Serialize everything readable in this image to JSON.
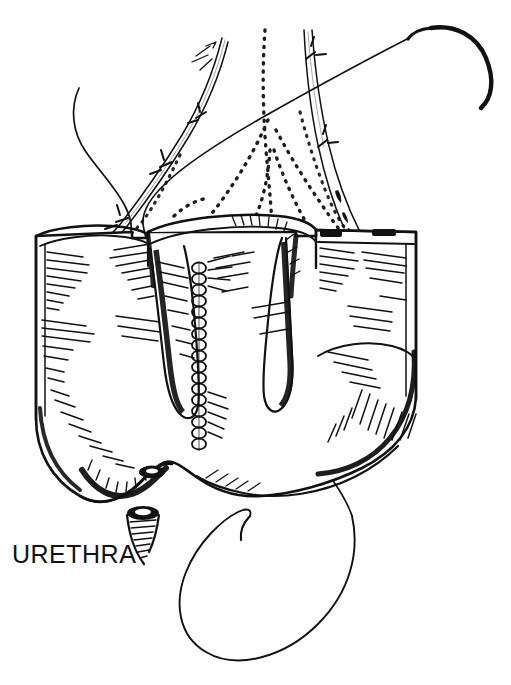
{
  "figure": {
    "domain": "anatomical-line-illustration",
    "background_color": "#ffffff",
    "ink_color": "#111111",
    "width": 511,
    "height": 685,
    "style": "black-and-white pen-and-ink medical line drawing with cross-hatch shading"
  },
  "labels": [
    {
      "id": "urethra",
      "text": "URETHRA",
      "x": 12,
      "y": 540,
      "font_size": 25,
      "color": "#111111"
    }
  ],
  "anatomy": {
    "parts": [
      {
        "name": "left-bladder-flap",
        "note": "left everted wall flap, hatched interior"
      },
      {
        "name": "center-bladder-flap",
        "note": "central tube-like flap with dark medial fold"
      },
      {
        "name": "right-bladder-flap",
        "note": "right everted wall flap, rectangular cut edge"
      },
      {
        "name": "bladder-base",
        "note": "rounded lower bladder body with dense hatching"
      },
      {
        "name": "ureteric-orifice",
        "note": "small dark oval opening on left bladder floor"
      },
      {
        "name": "urethral-stump",
        "note": "short cut tube below bladder neck, ringed shading"
      },
      {
        "name": "left-ureter",
        "note": "tubular vessel descending from upper-left"
      },
      {
        "name": "right-ureter",
        "note": "tubular vessel descending from upper-right"
      },
      {
        "name": "stippled-fascial-planes",
        "note": "dotted peritoneal reflection lines over dome"
      }
    ]
  },
  "instruments": {
    "items": [
      {
        "name": "curved-suture-needle",
        "note": "curved swaged needle at upper right"
      },
      {
        "name": "suture-thread-long",
        "note": "long thread running from needle down-left across field"
      },
      {
        "name": "suture-thread-loop",
        "note": "large free loop of thread hanging below bladder"
      },
      {
        "name": "running-suture-chain",
        "note": "chain of interlocking stitches down the midline"
      },
      {
        "name": "suture-thread-upper-left",
        "note": "thread tail curving at upper left"
      }
    ]
  },
  "colors": {
    "ink": "#111111",
    "paper": "#ffffff",
    "shadow_fill": "#1a1a1a"
  }
}
